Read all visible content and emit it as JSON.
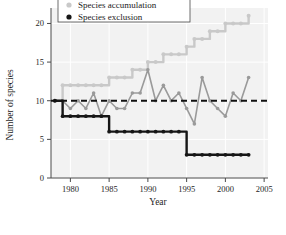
{
  "chart_data": {
    "type": "line",
    "title": "",
    "xlabel": "Year",
    "ylabel": "Number of species",
    "xlim": [
      1977.5,
      2005.5
    ],
    "ylim": [
      0,
      22
    ],
    "xticks": [
      1980,
      1985,
      1990,
      1995,
      2000,
      2005
    ],
    "yticks": [
      0,
      5,
      10,
      15,
      20
    ],
    "grid": true,
    "legend_position": "top-center",
    "reference_line": {
      "label": "",
      "y": 10,
      "style": "dashed",
      "color": "#111111"
    },
    "series": [
      {
        "name": "Species accumulation",
        "color": "#c9c9c9",
        "marker": "circle",
        "x": [
          1978,
          1979,
          1980,
          1981,
          1982,
          1983,
          1984,
          1985,
          1986,
          1987,
          1988,
          1989,
          1990,
          1991,
          1992,
          1993,
          1994,
          1995,
          1996,
          1997,
          1998,
          1999,
          2000,
          2001,
          2002,
          2003
        ],
        "values": [
          10,
          12,
          12,
          12,
          12,
          12,
          12,
          13,
          13,
          13,
          14,
          14,
          15,
          15,
          16,
          16,
          16,
          17,
          18,
          18,
          19,
          19,
          20,
          20,
          20,
          21
        ]
      },
      {
        "name": "Species richness",
        "color": "#9a9a9a",
        "marker": "circle",
        "x": [
          1978,
          1979,
          1980,
          1981,
          1982,
          1983,
          1984,
          1985,
          1986,
          1987,
          1988,
          1989,
          1990,
          1991,
          1992,
          1993,
          1994,
          1995,
          1996,
          1997,
          1998,
          1999,
          2000,
          2001,
          2002,
          2003
        ],
        "values": [
          10,
          10,
          9,
          10,
          9,
          11,
          8,
          10,
          9,
          9,
          11,
          11,
          14,
          10,
          12,
          10,
          11,
          9,
          7,
          13,
          10,
          9,
          8,
          11,
          10,
          13
        ]
      },
      {
        "name": "Species exclusion",
        "color": "#161616",
        "marker": "circle",
        "x": [
          1978,
          1979,
          1980,
          1981,
          1982,
          1983,
          1984,
          1985,
          1986,
          1987,
          1988,
          1989,
          1990,
          1991,
          1992,
          1993,
          1994,
          1995,
          1996,
          1997,
          1998,
          1999,
          2000,
          2001,
          2002,
          2003
        ],
        "values": [
          10,
          8,
          8,
          8,
          8,
          8,
          8,
          6,
          6,
          6,
          6,
          6,
          6,
          6,
          6,
          6,
          6,
          3,
          3,
          3,
          3,
          3,
          3,
          3,
          3,
          3
        ]
      }
    ]
  },
  "legend": {
    "items": [
      {
        "label": "Species accumulation",
        "color": "#c9c9c9"
      },
      {
        "label": "Species exclusion",
        "color": "#161616"
      }
    ]
  },
  "axes": {
    "ylabel": "Number of species",
    "xlabel": "Year",
    "xtick_labels": [
      "1980",
      "1985",
      "1990",
      "1995",
      "2000",
      "2005"
    ],
    "ytick_labels": [
      "0",
      "5",
      "10",
      "15",
      "20"
    ]
  },
  "colors": {
    "plot_background": "#f2f2f2",
    "grid": "#ffffff",
    "axis": "#4a4a4a",
    "accumulation": "#c9c9c9",
    "richness": "#9a9a9a",
    "exclusion": "#161616",
    "reference_dash": "#111111"
  }
}
